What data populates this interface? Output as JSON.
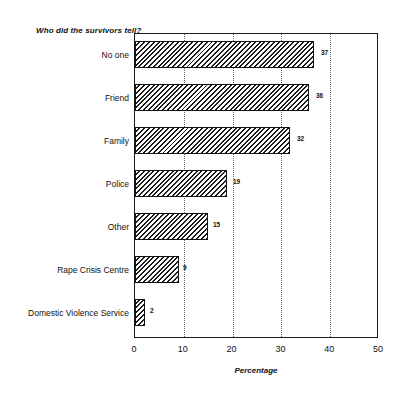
{
  "chart_data": {
    "type": "bar",
    "orientation": "horizontal",
    "title": "Who did the survivors tell?",
    "xlabel": "Percentage",
    "ylabel": "",
    "categories": [
      "No one",
      "Friend",
      "Family",
      "Police",
      "Other",
      "Rape Crisis Centre",
      "Domestic Violence Service"
    ],
    "values": [
      37,
      36,
      32,
      19,
      15,
      9,
      2
    ],
    "data_labels": [
      "37",
      "36",
      "32",
      "19",
      "15",
      "9",
      "2"
    ],
    "xlim": [
      0,
      50
    ],
    "xticks": [
      0,
      10,
      20,
      30,
      40,
      50
    ],
    "xtick_labels": [
      "0",
      "10",
      "20",
      "30",
      "40",
      "50"
    ],
    "grid": "vertical-dotted",
    "legend": "none",
    "bar_fill": "diagonal-hatch",
    "bar_edge_color": "#111111",
    "background_color": "#ffffff"
  }
}
